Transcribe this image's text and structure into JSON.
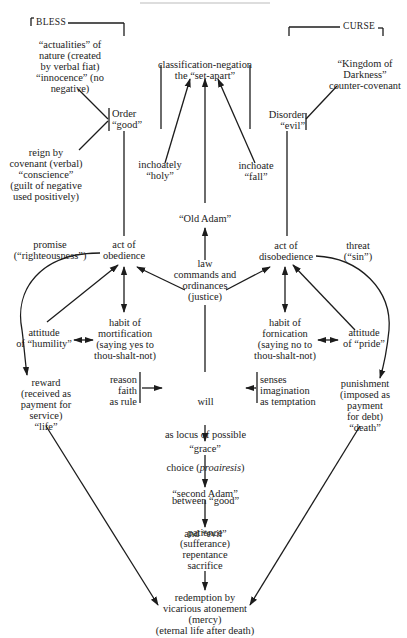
{
  "diagram": {
    "headings": {
      "bless": "BLESS",
      "curse": "CURSE"
    },
    "nodes": {
      "actualities": "“actualities” of\nnature (created\nby verbal fiat)\n“innocence” (no\nnegative)",
      "classification": "classification-negation\nthe “set-apart”",
      "kingdom": "“Kingdom of\nDarkness”\ncounter-covenant",
      "order": "Order\n“good”",
      "disorder": "Disorder\n“evil”",
      "reign": "reign by\ncovenant (verbal)\n“conscience”\n(guilt of negative\nused positively)",
      "inchoately_holy": "inchoately\n“holy”",
      "inchoate_fall": "inchoate\n“fall”",
      "old_adam": "“Old Adam”",
      "promise": "promise\n(“righteousness”)",
      "act_obedience": "act of\nobedience",
      "law": "law\ncommands and\nordinances\n(justice)",
      "act_disobedience": "act of\ndisobedience",
      "threat": "threat\n(“sin”)",
      "attitude_humility": "attitude\nof “humility”",
      "habit_mortification": "habit of\nmortification\n(saying yes to\nthou-shalt-not)",
      "habit_fornication": "habit of\nfornication\n(saying no to\nthou-shalt-not)",
      "attitude_pride": "attitude\nof “pride”",
      "reward": "reward\n(received as\npayment for\nservice)\n“life”",
      "reason": "reason\nfaith\nas rule",
      "will_line1": "will",
      "will_line2": "as locus of possible",
      "will_line3_pre": "choice (",
      "will_line3_it": "proairesis",
      "will_line3_post": ")",
      "will_line4": "between “good”",
      "will_line5": "and “evil”",
      "senses": "senses\nimagination\nas temptation",
      "punishment": "punishment\n(imposed as\npayment\nfor debt)\n“death”",
      "grace": "“grace”",
      "second_adam": "“second Adam”",
      "patience": "patience\n(sufferance)\nrepentance\nsacrifice",
      "redemption": "redemption by\nvicarious atonement\n(mercy)\n(eternal life after death)"
    },
    "colors": {
      "ink": "#1c1c1c",
      "paper": "#ffffff"
    }
  }
}
